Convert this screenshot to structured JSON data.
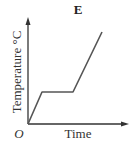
{
  "chart_data": {
    "type": "line",
    "title": "E",
    "xlabel": "Time",
    "ylabel": "Temperature °C",
    "origin_label": "O",
    "grid": false,
    "legend": null,
    "points": [
      {
        "x": 0,
        "y": 0
      },
      {
        "x": 14,
        "y": 32
      },
      {
        "x": 45,
        "y": 32
      },
      {
        "x": 74,
        "y": 92
      }
    ],
    "line_color": "#555555",
    "axis_color": "#333333"
  }
}
